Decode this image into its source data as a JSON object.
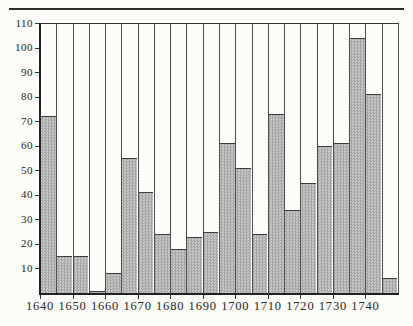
{
  "figure": {
    "background_color": "#fcfcf9",
    "top_rule_color": "#2b2b2b",
    "ink_color": "#242424"
  },
  "chart_data": {
    "type": "bar",
    "title": "",
    "xlabel": "",
    "ylabel": "",
    "bin_width_years": 5,
    "categories": [
      "1640",
      "1645",
      "1650",
      "1655",
      "1660",
      "1665",
      "1670",
      "1675",
      "1680",
      "1685",
      "1690",
      "1695",
      "1700",
      "1705",
      "1710",
      "1715",
      "1720",
      "1725",
      "1730",
      "1735",
      "1740",
      "1745"
    ],
    "values": [
      72,
      15,
      15,
      1,
      8,
      55,
      41,
      24,
      18,
      23,
      25,
      61,
      51,
      24,
      73,
      34,
      45,
      60,
      61,
      104,
      81,
      6
    ],
    "x_tick_labels": [
      "1640",
      "1650",
      "1660",
      "1670",
      "1680",
      "1690",
      "1700",
      "1710",
      "1720",
      "1730",
      "1740"
    ],
    "y_tick_values": [
      10,
      20,
      30,
      40,
      50,
      60,
      70,
      80,
      90,
      100,
      110
    ],
    "ylim": [
      0,
      110
    ],
    "xlim_years": [
      1640,
      1750
    ],
    "grid": "vertical line at every 5-year bar boundary, full height",
    "legend": "none",
    "bar_fill_style": "halftone checker",
    "bar_fill_dark": "#a6a6a6",
    "bar_fill_light": "#c9c9c9",
    "axis_color": "#222222",
    "gridline_color": "#4a4a4a"
  }
}
